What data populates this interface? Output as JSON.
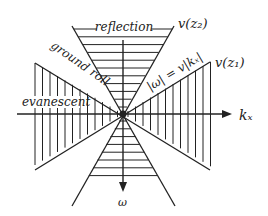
{
  "diagram": {
    "labels": {
      "reflection": "reflection",
      "ground_roll": "ground roll",
      "evanescent": "evanescent",
      "v_z2": "v(z₂)",
      "v_z1": "v(z₁)",
      "dispersion": "|ω| = v|kₓ|",
      "kx_axis": "kₓ",
      "omega_axis": "ω"
    },
    "colors": {
      "line": "#222222",
      "background": "#ffffff"
    }
  }
}
